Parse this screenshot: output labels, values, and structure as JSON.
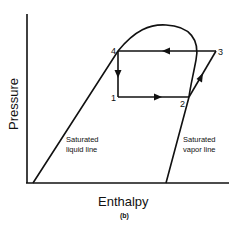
{
  "diagram": {
    "type": "pressure-enthalpy-refrigeration-cycle",
    "axes": {
      "x_label": "Enthalpy",
      "y_label": "Pressure"
    },
    "curves": {
      "liquid_line_label_1": "Saturated",
      "liquid_line_label_2": "liquid line",
      "vapor_line_label_1": "Saturated",
      "vapor_line_label_2": "vapor line"
    },
    "points": [
      {
        "id": "1",
        "label": "1"
      },
      {
        "id": "2",
        "label": "2"
      },
      {
        "id": "3",
        "label": "3"
      },
      {
        "id": "4",
        "label": "4"
      }
    ],
    "process_path": [
      "1",
      "2",
      "3",
      "4",
      "1"
    ],
    "caption": "(b)",
    "colors": {
      "line": "#111111",
      "background": "#ffffff"
    }
  }
}
